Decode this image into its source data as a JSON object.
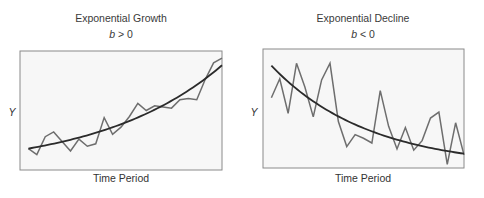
{
  "chart_data": [
    {
      "type": "line",
      "title": "Exponential Growth",
      "subtitle_var": "b",
      "subtitle_rest": " > 0",
      "xlabel": "Time Period",
      "ylabel": "Y",
      "grid": false,
      "xlim": [
        0,
        24
      ],
      "ylim": [
        0,
        10
      ],
      "series": [
        {
          "name": "observed",
          "x": [
            1,
            2,
            3,
            4,
            5,
            6,
            7,
            8,
            9,
            10,
            11,
            12,
            13,
            14,
            15,
            16,
            17,
            18,
            19,
            20,
            21,
            22,
            23,
            24
          ],
          "values": [
            1.8,
            1.3,
            2.8,
            3.2,
            2.4,
            1.6,
            2.6,
            2.0,
            2.2,
            4.4,
            3.0,
            3.6,
            4.5,
            5.6,
            5.0,
            5.4,
            5.3,
            5.2,
            5.9,
            6.0,
            5.9,
            7.6,
            9.0,
            9.4
          ]
        },
        {
          "name": "exponential trend",
          "trend": "growth",
          "start": 1.8,
          "end": 8.8
        }
      ]
    },
    {
      "type": "line",
      "title": "Exponential Decline",
      "subtitle_var": "b",
      "subtitle_rest": " < 0",
      "xlabel": "Time Period",
      "ylabel": "Y",
      "grid": false,
      "xlim": [
        0,
        24
      ],
      "ylim": [
        0,
        10
      ],
      "series": [
        {
          "name": "observed",
          "x": [
            1,
            2,
            3,
            4,
            5,
            6,
            7,
            8,
            9,
            10,
            11,
            12,
            13,
            14,
            15,
            16,
            17,
            18,
            19,
            20,
            21,
            22,
            23,
            24
          ],
          "values": [
            5.9,
            7.5,
            4.6,
            8.8,
            6.8,
            4.3,
            7.4,
            8.8,
            3.9,
            1.8,
            2.8,
            2.5,
            2.1,
            6.5,
            3.5,
            1.6,
            3.4,
            1.5,
            2.3,
            4.2,
            4.7,
            0.3,
            3.8,
            1.1
          ]
        },
        {
          "name": "exponential trend",
          "trend": "decline",
          "start": 8.6,
          "end": 1.2
        }
      ]
    }
  ]
}
